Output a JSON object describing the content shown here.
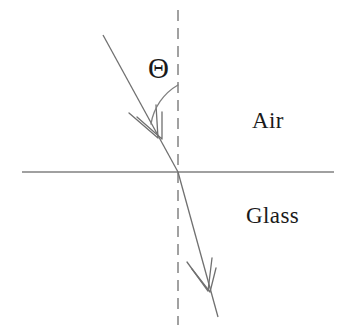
{
  "diagram": {
    "background_color": "#ffffff",
    "line_color": "#808080",
    "text_color": "#1a1a1a",
    "width": 344,
    "height": 332,
    "labels": {
      "upper_medium": "Air",
      "lower_medium": "Glass",
      "angle_symbol": "Θ"
    },
    "elements": {
      "interface_line_name": "air-glass interface",
      "normal_line_name": "normal (dashed)",
      "incident_ray_name": "incident ray",
      "refracted_ray_name": "refracted ray",
      "angle_arc_name": "angle of incidence arc"
    },
    "geometry": {
      "interface_y": 172,
      "interface_x_start": 22,
      "interface_x_end": 334,
      "normal_x": 178,
      "normal_y_start": 10,
      "normal_y_end": 325,
      "incidence_point_x": 178,
      "incidence_point_y": 172,
      "incident_start_x": 103,
      "incident_start_y": 35,
      "refracted_end_x": 218,
      "refracted_end_y": 317,
      "angle_of_incidence_deg": 29,
      "angle_of_refraction_deg": 14,
      "arc_radius": 55
    }
  }
}
